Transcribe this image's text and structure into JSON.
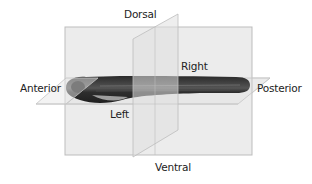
{
  "diagram": {
    "labels": {
      "dorsal": "Dorsal",
      "ventral": "Ventral",
      "anterior": "Anterior",
      "posterior": "Posterior",
      "left": "Left",
      "right": "Right"
    },
    "planes": [
      "sagittal",
      "transverse",
      "horizontal"
    ],
    "colors": {
      "plane_fill": "#e9e9e9",
      "plane_edge": "#b8b8b8",
      "fish_body": "#3a3a3a"
    }
  }
}
